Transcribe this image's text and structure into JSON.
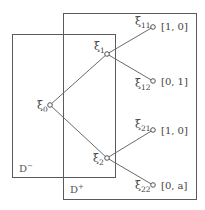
{
  "regions": [
    {
      "id": "d-minus",
      "symbol": "D",
      "sup": "−"
    },
    {
      "id": "d-plus",
      "symbol": "D",
      "sup": "+"
    }
  ],
  "nodes": [
    {
      "id": "xi0",
      "base": "ξ",
      "sub": "0"
    },
    {
      "id": "xi1",
      "base": "ξ",
      "sub": "1"
    },
    {
      "id": "xi2",
      "base": "ξ",
      "sub": "2"
    },
    {
      "id": "xi11",
      "base": "ξ",
      "sub": "11",
      "value": "[1, 0]"
    },
    {
      "id": "xi12",
      "base": "ξ",
      "sub": "12",
      "value": "[0, 1]"
    },
    {
      "id": "xi21",
      "base": "ξ",
      "sub": "21",
      "value": "[1, 0]"
    },
    {
      "id": "xi22",
      "base": "ξ",
      "sub": "22",
      "value": "[0, a]"
    }
  ],
  "edges": [
    [
      "xi0",
      "xi1"
    ],
    [
      "xi0",
      "xi2"
    ],
    [
      "xi1",
      "xi11"
    ],
    [
      "xi1",
      "xi12"
    ],
    [
      "xi2",
      "xi21"
    ],
    [
      "xi2",
      "xi22"
    ]
  ]
}
